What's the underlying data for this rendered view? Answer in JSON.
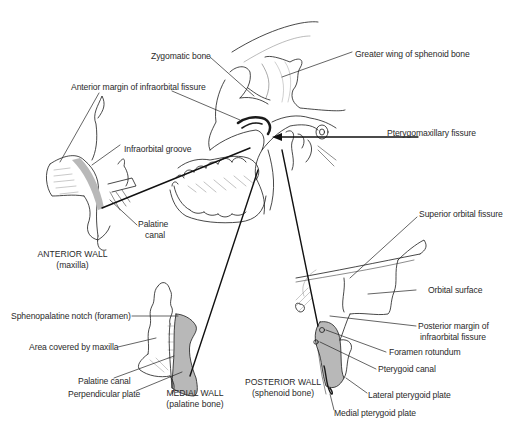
{
  "diagram": {
    "labels": {
      "zygomatic_bone": "Zygomatic bone",
      "greater_wing": "Greater wing of sphenoid bone",
      "anterior_margin": "Anterior margin of infraorbital fissure",
      "infraorbital_groove": "Infraorbital groove",
      "pterygomaxillary_fissure": "Pterygomaxillary fissure",
      "palatine_canal_anterior_1": "Palatine",
      "palatine_canal_anterior_2": "canal",
      "superior_orbital_fissure": "Superior orbital fissure",
      "orbital_surface": "Orbital surface",
      "posterior_margin_1": "Posterior margin of",
      "posterior_margin_2": "infraorbital fissure",
      "foramen_rotundum": "Foramen rotundum",
      "pterygoid_canal": "Pterygoid canal",
      "lateral_pterygoid_plate": "Lateral pterygoid plate",
      "medial_pterygoid_plate": "Medial pterygoid plate",
      "sphenopalatine_notch": "Sphenopalatine notch (foramen)",
      "area_covered_by_maxilla": "Area covered by maxilla",
      "palatine_canal_medial": "Palatine canal",
      "perpendicular_plate": "Perpendicular plate"
    },
    "captions": {
      "anterior_wall": {
        "title": "ANTERIOR WALL",
        "subtitle": "(maxilla)"
      },
      "medial_wall": {
        "title": "MEDIAL WALL",
        "subtitle": "(palatine bone)"
      },
      "posterior_wall": {
        "title": "POSTERIOR WALL",
        "subtitle": "(sphenoid bone)"
      }
    },
    "colors": {
      "line": "#1a1a1a",
      "shade": "#b8b8b8",
      "text": "#2a2a2a"
    }
  }
}
